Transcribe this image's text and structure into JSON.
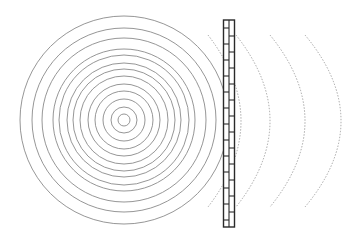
{
  "diagram": {
    "source": {
      "center": [
        124,
        120
      ],
      "ring_radii": [
        6,
        13,
        21,
        29,
        36,
        44,
        51,
        57,
        65,
        71,
        82,
        92,
        104
      ],
      "stroke": "#8a8a8a"
    },
    "wall": {
      "x": 223.5,
      "y": 20,
      "width": 11,
      "height": 207,
      "brick_period": 16,
      "stroke": "#2a2a2a"
    },
    "transmitted_waves": {
      "stroke": "#9a9a9a",
      "arcs": [
        {
          "top": [
            208,
            35
          ],
          "apex": [
            241,
            121
          ],
          "bottom": [
            208,
            207
          ]
        },
        {
          "top": [
            236,
            35
          ],
          "apex": [
            270,
            121
          ],
          "bottom": [
            236,
            207
          ]
        },
        {
          "top": [
            270,
            35
          ],
          "apex": [
            305,
            121
          ],
          "bottom": [
            270,
            207
          ]
        },
        {
          "top": [
            305,
            35
          ],
          "apex": [
            341,
            121
          ],
          "bottom": [
            305,
            207
          ]
        }
      ]
    }
  }
}
